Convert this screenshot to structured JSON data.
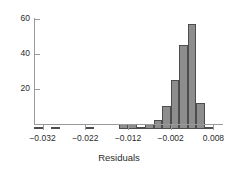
{
  "chart_data": {
    "type": "bar",
    "title": "",
    "subtitle": "",
    "xlabel": "Residuals",
    "ylabel": "",
    "grid": false,
    "legend": false,
    "bin_width": 0.002,
    "xlim": [
      -0.034,
      0.01
    ],
    "ylim": [
      0,
      63
    ],
    "x_tick_labels": [
      "−0.032",
      "−0.022",
      "−0.012",
      "−0.002",
      "0.008"
    ],
    "x_tick_values": [
      -0.032,
      -0.022,
      -0.012,
      -0.002,
      0.008
    ],
    "y_tick_labels": [
      "20",
      "40",
      "60"
    ],
    "y_tick_values": [
      20,
      40,
      60
    ],
    "categories": [
      "-0.033",
      "-0.031",
      "-0.029",
      "-0.027",
      "-0.025",
      "-0.023",
      "-0.021",
      "-0.019",
      "-0.017",
      "-0.015",
      "-0.013",
      "-0.011",
      "-0.009",
      "-0.007",
      "-0.005",
      "-0.003",
      "-0.001",
      "0.001",
      "0.003",
      "0.005",
      "0.007"
    ],
    "bin_left_edges": [
      -0.034,
      -0.032,
      -0.03,
      -0.028,
      -0.026,
      -0.024,
      -0.022,
      -0.02,
      -0.018,
      -0.016,
      -0.014,
      -0.012,
      -0.01,
      -0.008,
      -0.006,
      -0.004,
      -0.002,
      0.0,
      0.002,
      0.004,
      0.006
    ],
    "values": [
      1,
      0,
      1,
      0,
      0,
      0,
      1,
      0,
      0,
      0,
      3,
      3,
      1,
      3,
      5,
      13,
      28,
      48,
      60,
      15,
      1
    ],
    "bar_fill_color": "#8d8d8d",
    "bar_border_color": "#4d4d4d",
    "axis_color": "#9a9a9a",
    "text_color": "#2b2b2b",
    "background_color": "#ffffff"
  }
}
